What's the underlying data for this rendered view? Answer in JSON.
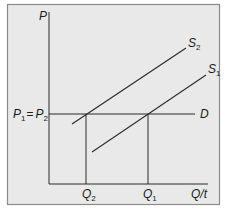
{
  "diagram": {
    "type": "supply-demand",
    "colors": {
      "background": "#e9e9e9",
      "frame": "#8a8a8a",
      "lines": "#2a2a2a",
      "text": "#1a1a1a"
    },
    "axes": {
      "y_label": "P",
      "x_label": "Q/t"
    },
    "curves": {
      "supply_2": {
        "label": "S",
        "sub": "2"
      },
      "supply_1": {
        "label": "S",
        "sub": "1"
      },
      "demand": {
        "label": "D"
      }
    },
    "price_label": {
      "p1": "P",
      "p1_sub": "1",
      "eq": "=",
      "p2": "P",
      "p2_sub": "2"
    },
    "quantity_labels": {
      "q2": {
        "label": "Q",
        "sub": "2"
      },
      "q1": {
        "label": "Q",
        "sub": "1"
      }
    }
  }
}
